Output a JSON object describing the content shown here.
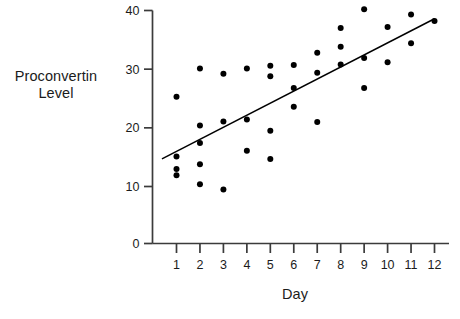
{
  "chart_data": {
    "type": "scatter",
    "title": "",
    "xlabel": "Day",
    "ylabel": "Proconvertin Level",
    "ylabel_lines": [
      "Proconvertin",
      "Level"
    ],
    "xlim": [
      0.35,
      12.65
    ],
    "ylim": [
      0,
      41
    ],
    "xticks": [
      1,
      2,
      3,
      4,
      5,
      6,
      7,
      8,
      9,
      10,
      11,
      12
    ],
    "xtick_labels": [
      "1",
      "2",
      "3",
      "4",
      "5",
      "6",
      "7",
      "8",
      "9",
      "10",
      "11",
      "12"
    ],
    "yticks": [
      0,
      10,
      20,
      30,
      40
    ],
    "ytick_labels": [
      "0",
      "10",
      "20",
      "30",
      "40"
    ],
    "y_axis_break": true,
    "grid": false,
    "legend": null,
    "marker": "filled-circle",
    "marker_color": "#000000",
    "line_color": "#000000",
    "axis_color": "#3b3b3b",
    "background_color": "#ffffff",
    "points": [
      {
        "x": 1,
        "y": 25.3
      },
      {
        "x": 1,
        "y": 15.1
      },
      {
        "x": 1,
        "y": 13.0
      },
      {
        "x": 1,
        "y": 11.9
      },
      {
        "x": 2,
        "y": 30.1
      },
      {
        "x": 2,
        "y": 20.4
      },
      {
        "x": 2,
        "y": 17.4
      },
      {
        "x": 2,
        "y": 13.8
      },
      {
        "x": 2,
        "y": 10.4
      },
      {
        "x": 3,
        "y": 29.2
      },
      {
        "x": 3,
        "y": 21.1
      },
      {
        "x": 3,
        "y": 9.5
      },
      {
        "x": 4,
        "y": 30.1
      },
      {
        "x": 4,
        "y": 21.4
      },
      {
        "x": 4,
        "y": 16.1
      },
      {
        "x": 5,
        "y": 30.6
      },
      {
        "x": 5,
        "y": 28.8
      },
      {
        "x": 5,
        "y": 19.5
      },
      {
        "x": 5,
        "y": 14.7
      },
      {
        "x": 6,
        "y": 30.7
      },
      {
        "x": 6,
        "y": 26.8
      },
      {
        "x": 6,
        "y": 23.6
      },
      {
        "x": 7,
        "y": 32.8
      },
      {
        "x": 7,
        "y": 29.4
      },
      {
        "x": 7,
        "y": 21.0
      },
      {
        "x": 8,
        "y": 37.0
      },
      {
        "x": 8,
        "y": 33.8
      },
      {
        "x": 8,
        "y": 30.8
      },
      {
        "x": 9,
        "y": 40.2
      },
      {
        "x": 9,
        "y": 31.9
      },
      {
        "x": 9,
        "y": 26.8
      },
      {
        "x": 10,
        "y": 37.2
      },
      {
        "x": 10,
        "y": 31.2
      },
      {
        "x": 11,
        "y": 39.3
      },
      {
        "x": 11,
        "y": 34.4
      },
      {
        "x": 12,
        "y": 38.2
      }
    ],
    "fit_line": {
      "name": "least-squares regression line",
      "x_start": 0.38,
      "y_start": 14.7,
      "x_end": 12.0,
      "y_end": 38.6
    }
  }
}
